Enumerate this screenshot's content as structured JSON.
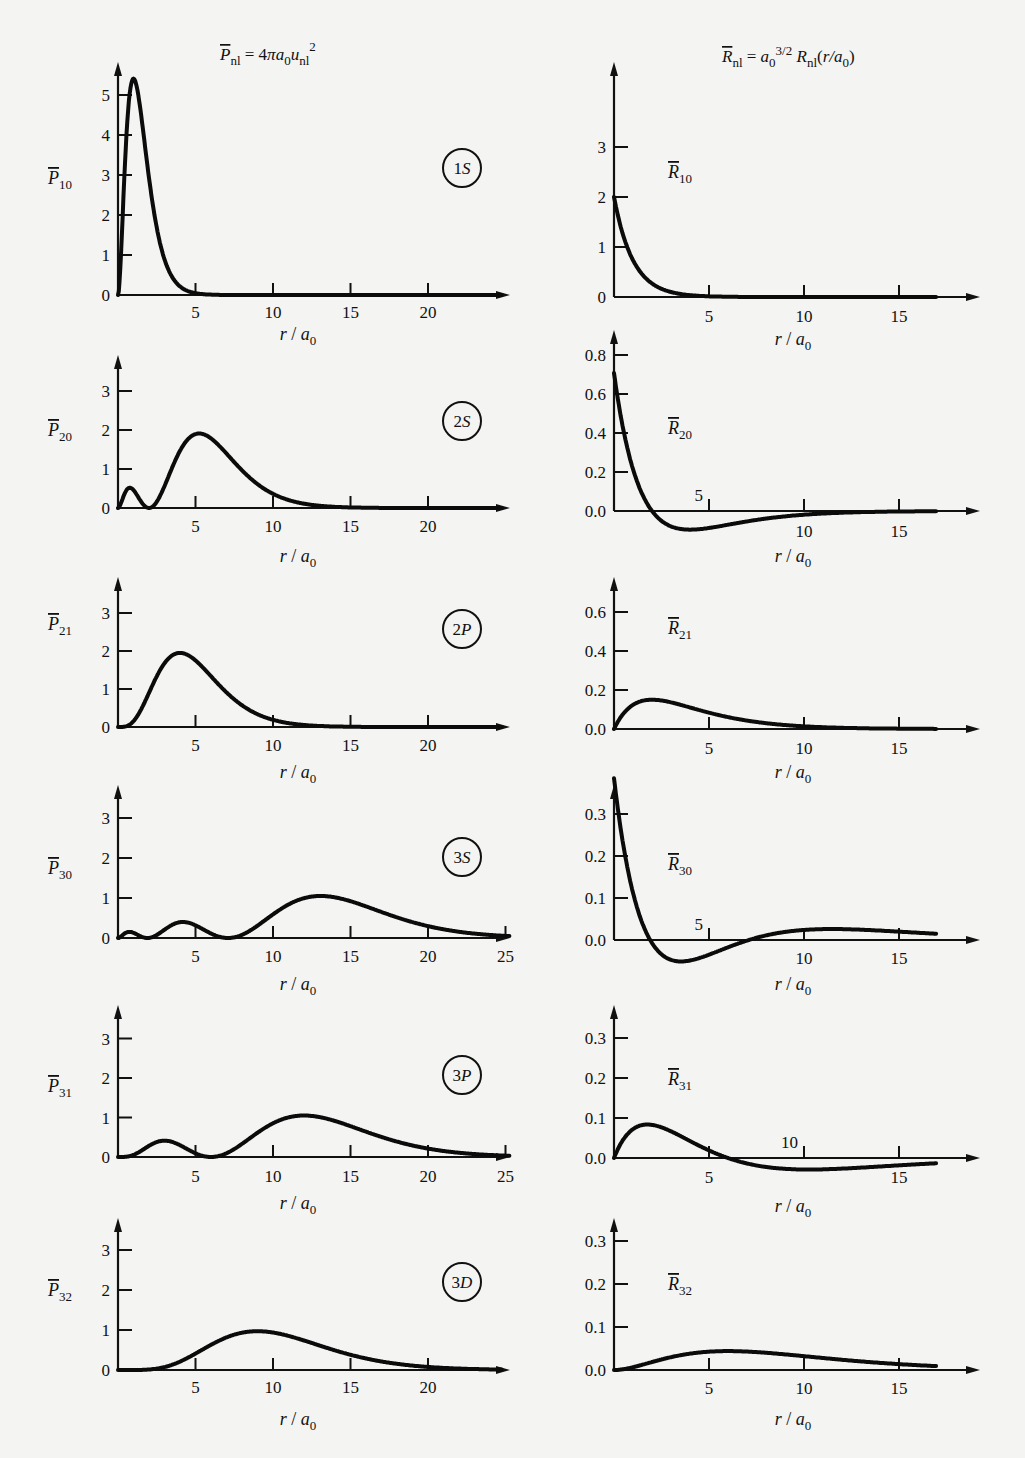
{
  "titles": {
    "left": "P̄nl = 4πa0 unl²",
    "right": "R̄nl = a0^(3/2) Rnl(r/a0)"
  },
  "xlabel": "r/a0",
  "chart_data": [
    {
      "type": "line",
      "id": "P10",
      "badge": "1S",
      "ylabel": "P̄10",
      "xlabel": "r/a0",
      "title": "P̄nl = 4πa0 unl²",
      "xticks": [
        5,
        10,
        15,
        20
      ],
      "yticks": [
        "0",
        "1",
        "2",
        "3",
        "4",
        "5"
      ],
      "xlim": [
        0,
        25
      ],
      "ylim": [
        0,
        5.5
      ],
      "x": [
        0,
        0.5,
        1,
        1.5,
        2,
        3,
        4,
        5,
        6,
        8,
        10
      ],
      "values": [
        0,
        4.9,
        5.41,
        4.48,
        2.93,
        1.34,
        0.54,
        0.23,
        0.09,
        0.01,
        0
      ]
    },
    {
      "type": "line",
      "id": "R10",
      "label": "R̄10",
      "xlabel": "r/a0",
      "title": "R̄nl = a0^(3/2) Rnl(r/a0)",
      "xticks": [
        5,
        10,
        15
      ],
      "yticks": [
        "0",
        "1",
        "2",
        "3"
      ],
      "xlim": [
        0,
        19
      ],
      "ylim": [
        0,
        3.5
      ],
      "x": [
        0,
        1,
        2,
        3,
        4,
        5,
        6
      ],
      "values": [
        2.0,
        0.74,
        0.27,
        0.1,
        0.04,
        0.01,
        0
      ]
    },
    {
      "type": "line",
      "id": "P20",
      "badge": "2S",
      "ylabel": "P̄20",
      "xlabel": "r/a0",
      "xticks": [
        5,
        10,
        15,
        20
      ],
      "yticks": [
        "0",
        "1",
        "2",
        "3"
      ],
      "xlim": [
        0,
        25
      ],
      "ylim": [
        0,
        3.5
      ],
      "x": [
        0,
        0.76,
        2,
        3,
        5.24,
        7,
        10,
        12,
        14
      ],
      "values": [
        0,
        0.41,
        0,
        0.7,
        1.91,
        1.45,
        0.36,
        0.1,
        0.02
      ]
    },
    {
      "type": "line",
      "id": "R20",
      "label": "R̄20",
      "xlabel": "r/a0",
      "xticks": [
        5,
        10,
        15
      ],
      "yticks": [
        "0.0",
        "0.2",
        "0.4",
        "0.6",
        "0.8"
      ],
      "xlim": [
        0,
        19
      ],
      "ylim": [
        -0.15,
        0.85
      ],
      "x": [
        0,
        1,
        2,
        3,
        4,
        5,
        6,
        8,
        10,
        12
      ],
      "values": [
        0.71,
        0.21,
        0,
        -0.08,
        -0.1,
        -0.09,
        -0.07,
        -0.04,
        -0.02,
        -0.01
      ]
    },
    {
      "type": "line",
      "id": "P21",
      "badge": "2P",
      "ylabel": "P̄21",
      "xlabel": "r/a0",
      "xticks": [
        5,
        10,
        15,
        20
      ],
      "yticks": [
        "0",
        "1",
        "2",
        "3"
      ],
      "xlim": [
        0,
        25
      ],
      "ylim": [
        0,
        3.5
      ],
      "x": [
        0,
        1,
        2,
        4,
        6,
        8,
        10,
        12,
        14
      ],
      "values": [
        0,
        0.16,
        0.73,
        1.95,
        1.34,
        0.6,
        0.21,
        0.07,
        0.02
      ]
    },
    {
      "type": "line",
      "id": "R21",
      "label": "R̄21",
      "xlabel": "r/a0",
      "xticks": [
        5,
        10,
        15
      ],
      "yticks": [
        "0.0",
        "0.2",
        "0.4",
        "0.6"
      ],
      "xlim": [
        0,
        19
      ],
      "ylim": [
        0,
        0.7
      ],
      "x": [
        0,
        1,
        2,
        3,
        4,
        5,
        6,
        8,
        10
      ],
      "values": [
        0,
        0.12,
        0.15,
        0.14,
        0.11,
        0.08,
        0.06,
        0.03,
        0.01
      ]
    },
    {
      "type": "line",
      "id": "P30",
      "badge": "3S",
      "ylabel": "P̄30",
      "xlabel": "r/a0",
      "xticks": [
        5,
        10,
        15,
        20,
        25
      ],
      "yticks": [
        "0",
        "1",
        "2",
        "3"
      ],
      "xlim": [
        0,
        25.5
      ],
      "ylim": [
        0,
        3.5
      ],
      "x": [
        0,
        0.74,
        1.9,
        4.19,
        7.1,
        10,
        13.07,
        16,
        20,
        25
      ],
      "values": [
        0,
        0.2,
        0,
        0.38,
        0,
        0.55,
        1.05,
        0.85,
        0.28,
        0.03
      ]
    },
    {
      "type": "line",
      "id": "R30",
      "label": "R̄30",
      "xlabel": "r/a0",
      "xticks": [
        5,
        10,
        15
      ],
      "yticks": [
        "0.0",
        "0.1",
        "0.2",
        "0.3"
      ],
      "xlim": [
        0,
        19
      ],
      "ylim": [
        -0.08,
        0.35
      ],
      "x": [
        0,
        1,
        1.9,
        3,
        4,
        5,
        7.1,
        9,
        10.5,
        13,
        15
      ],
      "values": [
        0.38,
        0.14,
        0,
        -0.06,
        -0.07,
        -0.06,
        0,
        0.02,
        0.03,
        0.01,
        0.01
      ]
    },
    {
      "type": "line",
      "id": "P31",
      "badge": "3P",
      "ylabel": "P̄31",
      "xlabel": "r/a0",
      "xticks": [
        5,
        10,
        15,
        20,
        25
      ],
      "yticks": [
        "0",
        "1",
        "2",
        "3"
      ],
      "xlim": [
        0,
        25.5
      ],
      "ylim": [
        0,
        3.5
      ],
      "x": [
        0,
        1,
        3,
        6,
        8,
        10,
        12,
        15,
        20,
        25
      ],
      "values": [
        0,
        0.1,
        0.45,
        0,
        0.25,
        0.75,
        1.05,
        0.8,
        0.2,
        0.02
      ]
    },
    {
      "type": "line",
      "id": "R31",
      "label": "R̄31",
      "xlabel": "r/a0",
      "xticks": [
        5,
        10,
        15
      ],
      "yticks": [
        "0.0",
        "0.1",
        "0.2",
        "0.3"
      ],
      "xlim": [
        0,
        19
      ],
      "ylim": [
        -0.05,
        0.35
      ],
      "x": [
        0,
        1,
        2,
        3,
        4,
        5,
        6,
        8,
        10,
        12,
        15,
        17
      ],
      "values": [
        0,
        0.07,
        0.09,
        0.08,
        0.05,
        0.02,
        0,
        -0.02,
        -0.03,
        -0.025,
        -0.01,
        0
      ]
    },
    {
      "type": "line",
      "id": "P32",
      "badge": "3D",
      "ylabel": "P̄32",
      "xlabel": "r/a0",
      "xticks": [
        5,
        10,
        15,
        20
      ],
      "yticks": [
        "0",
        "1",
        "2",
        "3"
      ],
      "xlim": [
        0,
        25
      ],
      "ylim": [
        0,
        3.5
      ],
      "x": [
        0,
        2.5,
        5,
        7.5,
        9,
        10,
        12.5,
        15,
        17.5,
        20,
        22
      ],
      "values": [
        0,
        0.05,
        0.35,
        0.8,
        0.97,
        0.97,
        0.75,
        0.45,
        0.2,
        0.07,
        0.02
      ]
    },
    {
      "type": "line",
      "id": "R32",
      "label": "R̄32",
      "xlabel": "r/a0",
      "xticks": [
        5,
        10,
        15
      ],
      "yticks": [
        "0.0",
        "0.1",
        "0.2",
        "0.3"
      ],
      "xlim": [
        0,
        19
      ],
      "ylim": [
        0,
        0.35
      ],
      "x": [
        0,
        2,
        4,
        5,
        6,
        8,
        10,
        12,
        14,
        16
      ],
      "values": [
        0,
        0.04,
        0.055,
        0.056,
        0.055,
        0.048,
        0.038,
        0.025,
        0.012,
        0.005
      ]
    }
  ]
}
